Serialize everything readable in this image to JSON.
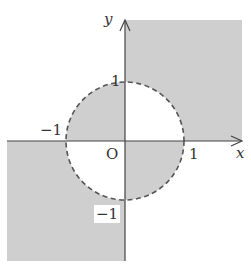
{
  "diagram": {
    "axes": {
      "x_label": "x",
      "y_label": "y",
      "origin_label": "O"
    },
    "ticks": {
      "x_pos": "1",
      "x_neg": "−1",
      "y_pos": "1",
      "y_neg": "−1"
    },
    "circle": {
      "center": [
        0,
        0
      ],
      "radius": 1,
      "style": "dashed"
    },
    "shaded_regions": [
      "x > 0, y > 0 outside unit circle",
      "x < 0, y > 0 inside unit circle",
      "x < 0, y < 0 outside unit circle",
      "x > 0, y < 0 inside unit circle"
    ],
    "colors": {
      "shade": "#cfcfcf",
      "axis": "#444444",
      "circle": "#555555"
    }
  }
}
